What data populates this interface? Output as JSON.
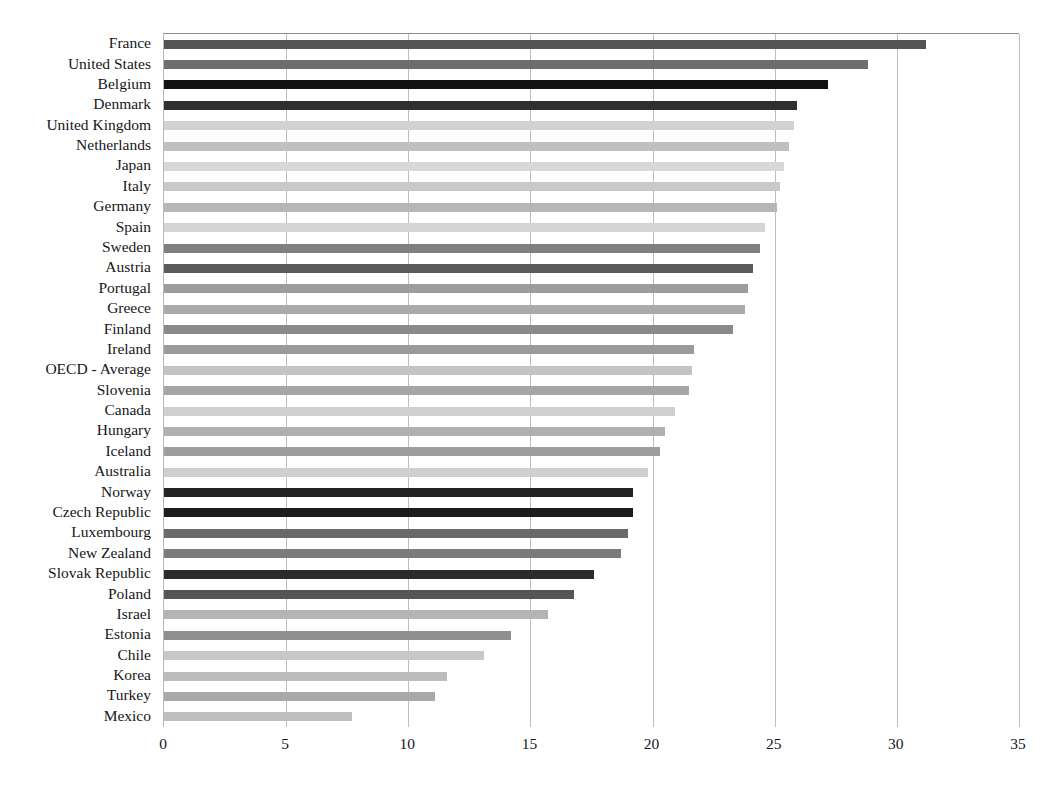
{
  "chart_data": {
    "type": "bar",
    "orientation": "horizontal",
    "title": "",
    "xlabel": "",
    "ylabel": "",
    "xlim": [
      0,
      35
    ],
    "xticks": [
      0,
      5,
      10,
      15,
      20,
      25,
      30,
      35
    ],
    "xtick_labels": [
      "0",
      "5",
      "10",
      "15",
      "20",
      "25",
      "30",
      "35"
    ],
    "grid": true,
    "legend": "none",
    "categories": [
      "France",
      "United States",
      "Belgium",
      "Denmark",
      "United Kingdom",
      "Netherlands",
      "Japan",
      "Italy",
      "Germany",
      "Spain",
      "Sweden",
      "Austria",
      "Portugal",
      "Greece",
      "Finland",
      "Ireland",
      "OECD - Average",
      "Slovenia",
      "Canada",
      "Hungary",
      "Iceland",
      "Australia",
      "Norway",
      "Czech Republic",
      "Luxembourg",
      "New Zealand",
      "Slovak Republic",
      "Poland",
      "Israel",
      "Estonia",
      "Chile",
      "Korea",
      "Turkey",
      "Mexico"
    ],
    "values": [
      31.2,
      28.8,
      27.2,
      25.9,
      25.8,
      25.6,
      25.4,
      25.2,
      25.1,
      24.6,
      24.4,
      24.1,
      23.9,
      23.8,
      23.3,
      21.7,
      21.6,
      21.5,
      20.9,
      20.5,
      20.3,
      19.8,
      19.2,
      19.2,
      19.0,
      18.7,
      17.6,
      16.8,
      15.7,
      14.2,
      13.1,
      11.6,
      11.1,
      7.7
    ],
    "bar_colors": [
      "#545454",
      "#6e6e6e",
      "#111111",
      "#303030",
      "#d2d2d2",
      "#c0c0c0",
      "#d8d8d8",
      "#c9c9c9",
      "#b6b6b6",
      "#d4d4d4",
      "#7f7f7f",
      "#5a5a5a",
      "#9d9d9d",
      "#aaaaaa",
      "#8a8a8a",
      "#9a9a9a",
      "#c4c4c4",
      "#a6a6a6",
      "#d0d0d0",
      "#b0b0b0",
      "#9e9e9e",
      "#cfcfcf",
      "#232323",
      "#1c1c1c",
      "#6a6a6a",
      "#7b7b7b",
      "#2b2b2b",
      "#555555",
      "#b4b4b4",
      "#8f8f8f",
      "#c7c7c7",
      "#bcbcbc",
      "#a9a9a9",
      "#bfbfbf"
    ],
    "grid_color": "#bdbdbd",
    "axis_color": "#8e8e8e",
    "background_color": "#ffffff"
  }
}
